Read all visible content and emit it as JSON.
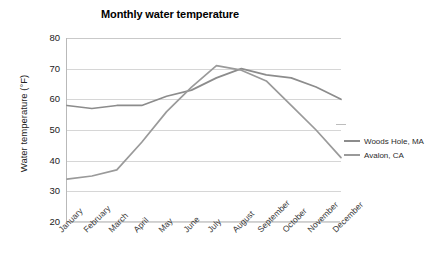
{
  "chart_data": {
    "type": "line",
    "title": "Monthly water temperature",
    "xlabel": "",
    "ylabel": "Water temperature (°F)",
    "categories": [
      "January",
      "February",
      "March",
      "April",
      "May",
      "June",
      "July",
      "August",
      "September",
      "October",
      "November",
      "December"
    ],
    "ylim": [
      20,
      80
    ],
    "ytick_step": 10,
    "yticks": [
      80,
      70,
      60,
      50,
      40,
      30,
      20
    ],
    "grid": true,
    "legend_position": "right",
    "series": [
      {
        "name": "Woods Hole, MA",
        "color": "#8c8c8c",
        "values": [
          58,
          57,
          58,
          58,
          61,
          63,
          67,
          70,
          68,
          67,
          64,
          60
        ]
      },
      {
        "name": "Avalon, CA",
        "color": "#9a9a9a",
        "values": [
          34,
          35,
          37,
          46,
          56,
          64,
          71,
          69.5,
          66,
          58,
          50,
          41
        ]
      }
    ]
  },
  "colors": {
    "background": "#ffffff",
    "grid": "#d6d6d6",
    "axis": "#b9b9b9",
    "title_text": "#000000",
    "tick_text": "#222222"
  }
}
